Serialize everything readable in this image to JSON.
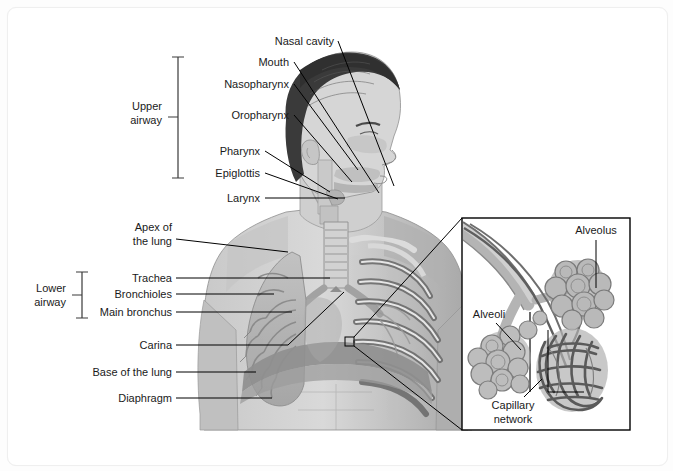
{
  "figure": {
    "background": "#ffffff",
    "card_border": "#efefef",
    "line_color": "#000000",
    "text_color": "#1a1a1a"
  },
  "brackets": [
    {
      "name": "upper-airway",
      "line1": "Upper",
      "line2": "airway",
      "x": 178,
      "y_top": 57,
      "y_bottom": 178,
      "label_x": 152,
      "label_y": 113
    },
    {
      "name": "lower-airway",
      "line1": "Lower",
      "line2": "airway",
      "x": 82,
      "y_top": 272,
      "y_bottom": 318,
      "label_x": 56,
      "label_y": 292
    }
  ],
  "labels_upper": [
    {
      "text": "Nasal cavity",
      "x": 334,
      "y": 45,
      "anchor": "end",
      "line": [
        338,
        41,
        394,
        186
      ]
    },
    {
      "text": "Mouth",
      "x": 289,
      "y": 66,
      "anchor": "end",
      "line": [
        294,
        62,
        379,
        193
      ]
    },
    {
      "text": "Nasopharynx",
      "x": 289,
      "y": 88,
      "anchor": "end",
      "line": [
        294,
        84,
        358,
        170
      ]
    },
    {
      "text": "Oropharynx",
      "x": 289,
      "y": 119,
      "anchor": "end",
      "line": [
        294,
        115,
        352,
        182
      ]
    },
    {
      "text": "Pharynx",
      "x": 260,
      "y": 155,
      "anchor": "end",
      "line": [
        265,
        151,
        330,
        192
      ]
    },
    {
      "text": "Epiglottis",
      "x": 260,
      "y": 177,
      "anchor": "end",
      "line": [
        265,
        173,
        338,
        198
      ]
    },
    {
      "text": "Larynx",
      "x": 260,
      "y": 202,
      "anchor": "end",
      "line": [
        265,
        198,
        345,
        198
      ]
    }
  ],
  "labels_lower": [
    {
      "text_line1": "Apex of",
      "text_line2": "the lung",
      "x": 172,
      "y": 231,
      "anchor": "end",
      "line": [
        176,
        239,
        285,
        251
      ]
    },
    {
      "text": "Trachea",
      "x": 172,
      "y": 281,
      "anchor": "end",
      "line": [
        176,
        278,
        330,
        278
      ]
    },
    {
      "text": "Bronchioles",
      "x": 172,
      "y": 297,
      "anchor": "end",
      "line": [
        176,
        294,
        272,
        294
      ]
    },
    {
      "text": "Main bronchus",
      "x": 172,
      "y": 315,
      "anchor": "end",
      "line": [
        176,
        312,
        290,
        312
      ]
    },
    {
      "text": "Carina",
      "x": 172,
      "y": 348,
      "anchor": "end",
      "line": [
        176,
        345,
        290,
        345,
        345,
        292
      ]
    },
    {
      "text": "Base of the lung",
      "x": 172,
      "y": 375,
      "anchor": "end",
      "line": [
        176,
        372,
        255,
        372
      ]
    },
    {
      "text": "Diaphragm",
      "x": 172,
      "y": 401,
      "anchor": "end",
      "line": [
        176,
        398,
        270,
        398
      ]
    }
  ],
  "inset": {
    "name": "alveoli-magnification",
    "box": {
      "x": 462,
      "y": 218,
      "width": 168,
      "height": 212
    },
    "source_marker": {
      "x": 349,
      "y": 341,
      "size": 8
    },
    "labels": [
      {
        "text": "Alveolus",
        "x": 596,
        "y": 234,
        "anchor": "middle",
        "line": [
          596,
          240,
          596,
          288
        ]
      },
      {
        "text": "Alveoli",
        "x": 489,
        "y": 318,
        "anchor": "middle",
        "line": [
          496,
          323,
          519,
          349
        ]
      },
      {
        "text_line1": "Capillary",
        "text_line2": "network",
        "x": 513,
        "y": 407,
        "anchor": "middle",
        "line": [
          521,
          399,
          540,
          381
        ]
      }
    ]
  },
  "palette": {
    "hair": "#3a3a3a",
    "skin_light": "#d8d8d8",
    "skin_mid": "#bdbdbd",
    "skin_dark": "#9d9d9d",
    "airway": "#c9c9c9",
    "lung": "#b6b6b6",
    "diaphragm": "#8f8f8f",
    "rib": "#6e6e6e",
    "vessel": "#6a6a6a"
  }
}
